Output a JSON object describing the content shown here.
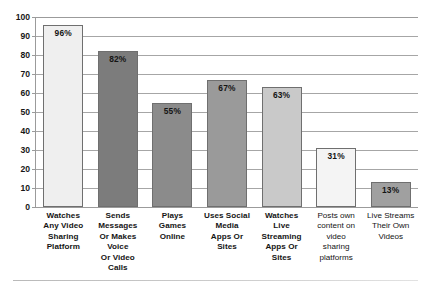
{
  "chart_data": {
    "type": "bar",
    "title": "",
    "subtitle": "",
    "xlabel": "",
    "ylabel": "",
    "ylim": [
      0,
      100
    ],
    "yticks": [
      0,
      10,
      20,
      30,
      40,
      50,
      60,
      70,
      80,
      90,
      100
    ],
    "ytick_labels": [
      "0",
      "10",
      "20",
      "30",
      "40",
      "50",
      "60",
      "70",
      "80",
      "90",
      "100"
    ],
    "grid": "horizontal",
    "legend": "none",
    "value_suffix": "%",
    "categories": [
      "Watches Any Video Sharing Platform",
      "Sends Messages Or Makes Voice Or Video Calls",
      "Plays Games Online",
      "Uses Social Media Apps Or Sites",
      "Watches Live Streaming Apps Or Sites",
      "Posts own content on video sharing platforms",
      "Live Streams Their Own Videos"
    ],
    "values": [
      96,
      82,
      55,
      67,
      63,
      31,
      13
    ],
    "data_labels": [
      "96%",
      "82%",
      "55%",
      "67%",
      "63%",
      "31%",
      "13%"
    ],
    "bar_colors": [
      "#efefef",
      "#7c7c7c",
      "#8b8b8b",
      "#9a9a9a",
      "#c9c9c9",
      "#f4f4f4",
      "#a0a0a0"
    ],
    "bar_border_color": "#6f6f6f",
    "gridline_color": "#a6a6a6",
    "axis_color": "#9b9b9b",
    "label_color": "#141414",
    "bars": [
      {
        "label_lines": [
          "Watches",
          "Any Video",
          "Sharing",
          "Platform"
        ],
        "value": 96,
        "data_label": "96%",
        "color": "#efefef",
        "label_style": "bold"
      },
      {
        "label_lines": [
          "Sends",
          "Messages",
          "Or Makes",
          "Voice",
          "Or Video",
          "Calls"
        ],
        "value": 82,
        "data_label": "82%",
        "color": "#7c7c7c",
        "label_style": "bold"
      },
      {
        "label_lines": [
          "Plays",
          "Games",
          "Online"
        ],
        "value": 55,
        "data_label": "55%",
        "color": "#8b8b8b",
        "label_style": "bold"
      },
      {
        "label_lines": [
          "Uses Social",
          "Media",
          "Apps Or",
          "Sites"
        ],
        "value": 67,
        "data_label": "67%",
        "color": "#9a9a9a",
        "label_style": "bold"
      },
      {
        "label_lines": [
          "Watches",
          "Live",
          "Streaming",
          "Apps Or",
          "Sites"
        ],
        "value": 63,
        "data_label": "63%",
        "color": "#c9c9c9",
        "label_style": "bold"
      },
      {
        "label_lines": [
          "Posts own",
          "content on",
          "video",
          "sharing",
          "platforms"
        ],
        "value": 31,
        "data_label": "31%",
        "color": "#f4f4f4",
        "label_style": "regular"
      },
      {
        "label_lines": [
          "Live Streams",
          "Their Own",
          "Videos"
        ],
        "value": 13,
        "data_label": "13%",
        "color": "#a0a0a0",
        "label_style": "regular"
      }
    ]
  }
}
